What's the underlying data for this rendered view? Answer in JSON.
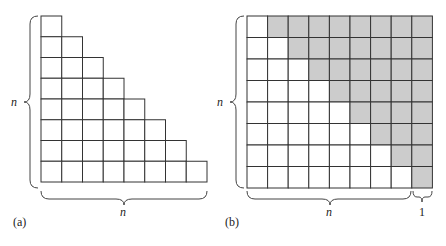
{
  "panels": [
    {
      "id": "a",
      "caption": "(a)",
      "n": 8,
      "shape": "staircase",
      "left_label": "n",
      "bottom_label": "n"
    },
    {
      "id": "b",
      "caption": "(b)",
      "rows": 8,
      "cols": 9,
      "shape": "rectangle n by n+1 split into two staircases",
      "left_label": "n",
      "bottom_label": "n",
      "extra_label": "1",
      "shaded_color": "#cccccc"
    }
  ],
  "colors": {
    "line": "#333333",
    "shade": "#cccccc",
    "background": "#ffffff"
  }
}
